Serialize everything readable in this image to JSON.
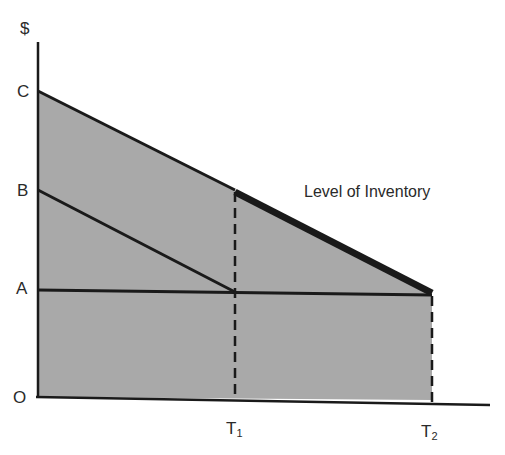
{
  "diagram": {
    "title": "",
    "y_axis_label": "$",
    "y_labels": [
      "C",
      "B",
      "A",
      "O"
    ],
    "x_labels": [
      {
        "main": "T",
        "sub": "1"
      },
      {
        "main": "T",
        "sub": "2"
      }
    ],
    "annotation": "Level of Inventory",
    "colors": {
      "fill": "#a9a9a9",
      "line": "#1a1a1a",
      "background": "#ffffff"
    }
  }
}
